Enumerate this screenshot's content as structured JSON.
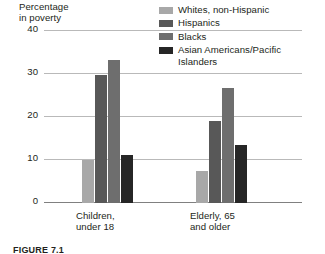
{
  "chart_data": {
    "type": "bar",
    "title": "",
    "ylabel": "Percentage\nin poverty",
    "xlabel": "",
    "ylim": [
      0,
      40
    ],
    "yticks": [
      0,
      10,
      20,
      30,
      40
    ],
    "ytick_labels": [
      "0",
      "10",
      "20",
      "30",
      "40"
    ],
    "grid": true,
    "legend_position": "top-right",
    "categories": [
      "Children,\nunder 18",
      "Elderly, 65\nand older"
    ],
    "series": [
      {
        "name": "Whites, non-Hispanic",
        "color": "#a8a8a8",
        "values": [
          10,
          7.5
        ]
      },
      {
        "name": "Hispanics",
        "color": "#585858",
        "values": [
          29.5,
          19
        ]
      },
      {
        "name": "Blacks",
        "color": "#6e6e6e",
        "values": [
          33,
          26.5
        ]
      },
      {
        "name": "Asian Americans/Pacific\nIslanders",
        "color": "#262626",
        "values": [
          11,
          13.5
        ]
      }
    ]
  },
  "axis": {
    "y_title": "Percentage\nin poverty",
    "ticks": [
      {
        "label": "40"
      },
      {
        "label": "30"
      },
      {
        "label": "20"
      },
      {
        "label": "10"
      },
      {
        "label": "0"
      }
    ]
  },
  "legend": {
    "items": [
      {
        "label": "Whites, non-Hispanic",
        "color": "#a8a8a8"
      },
      {
        "label": "Hispanics",
        "color": "#585858"
      },
      {
        "label": "Blacks",
        "color": "#6e6e6e"
      },
      {
        "label": "Asian Americans/Pacific\nIslanders",
        "color": "#262626"
      }
    ]
  },
  "xaxis": {
    "labels": [
      {
        "text": "Children,\nunder 18"
      },
      {
        "text": "Elderly, 65\nand older"
      }
    ]
  },
  "caption": {
    "text": "FIGURE 7.1"
  }
}
